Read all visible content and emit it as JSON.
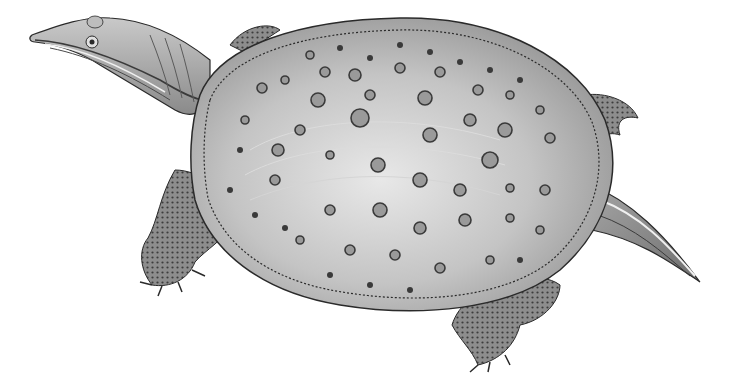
{
  "image": {
    "subject": "softshell turtle illustration",
    "style": "grayscale engraving",
    "background_color": "#ffffff",
    "shell_color": "#bdbdbd",
    "shell_highlight": "#e4e4e4",
    "spot_color": "#3a3a3a",
    "limb_color": "#8a8a8a",
    "outline_color": "#2a2a2a"
  },
  "spots": [
    [
      310,
      55,
      4
    ],
    [
      340,
      48,
      3
    ],
    [
      370,
      58,
      3
    ],
    [
      400,
      45,
      3
    ],
    [
      430,
      52,
      3
    ],
    [
      460,
      62,
      3
    ],
    [
      490,
      70,
      3
    ],
    [
      520,
      80,
      3
    ],
    [
      285,
      80,
      4
    ],
    [
      325,
      72,
      5
    ],
    [
      355,
      75,
      6
    ],
    [
      400,
      68,
      5
    ],
    [
      440,
      72,
      5
    ],
    [
      478,
      90,
      5
    ],
    [
      510,
      95,
      4
    ],
    [
      540,
      110,
      4
    ],
    [
      262,
      88,
      5
    ],
    [
      318,
      100,
      7
    ],
    [
      370,
      95,
      5
    ],
    [
      425,
      98,
      7
    ],
    [
      470,
      120,
      6
    ],
    [
      505,
      130,
      7
    ],
    [
      550,
      138,
      5
    ],
    [
      245,
      120,
      4
    ],
    [
      300,
      130,
      5
    ],
    [
      360,
      118,
      9
    ],
    [
      430,
      135,
      7
    ],
    [
      490,
      160,
      8
    ],
    [
      545,
      190,
      5
    ],
    [
      278,
      150,
      6
    ],
    [
      330,
      155,
      4
    ],
    [
      378,
      165,
      7
    ],
    [
      420,
      180,
      7
    ],
    [
      460,
      190,
      6
    ],
    [
      510,
      188,
      4
    ],
    [
      275,
      180,
      5
    ],
    [
      330,
      210,
      5
    ],
    [
      380,
      210,
      7
    ],
    [
      420,
      228,
      6
    ],
    [
      465,
      220,
      6
    ],
    [
      510,
      218,
      4
    ],
    [
      540,
      230,
      4
    ],
    [
      300,
      240,
      4
    ],
    [
      350,
      250,
      5
    ],
    [
      395,
      255,
      5
    ],
    [
      440,
      268,
      5
    ],
    [
      490,
      260,
      4
    ],
    [
      520,
      260,
      3
    ],
    [
      240,
      150,
      3
    ],
    [
      230,
      190,
      3
    ],
    [
      255,
      215,
      3
    ],
    [
      285,
      228,
      3
    ],
    [
      330,
      275,
      3
    ],
    [
      370,
      285,
      3
    ],
    [
      410,
      290,
      3
    ]
  ]
}
